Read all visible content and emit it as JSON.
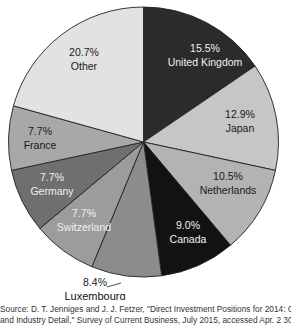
{
  "chart_data": {
    "type": "pie",
    "title": "",
    "categories": [
      "United Kingdom",
      "Japan",
      "Netherlands",
      "Canada",
      "Luxembourg",
      "Switzerland",
      "Germany",
      "France",
      "Other"
    ],
    "values": [
      15.5,
      12.9,
      10.5,
      9.0,
      8.4,
      7.7,
      7.7,
      7.7,
      20.7
    ],
    "labels": [
      "15.5%",
      "12.9%",
      "10.5%",
      "9.0%",
      "8.4%",
      "7.7%",
      "7.7%",
      "7.7%",
      "20.7%"
    ],
    "colors": [
      "#2b2b2b",
      "#c6c6c6",
      "#b3b3b3",
      "#121212",
      "#8c8c8c",
      "#9c9c9c",
      "#6f6f6f",
      "#a8a8a8",
      "#e2e2e2"
    ],
    "start_angle_deg": 0,
    "direction": "clockwise",
    "legend": "none (inline labels)"
  },
  "source_text_line1": "Source: D. T. Jenniges and J. J. Fetzer, \"Direct Investment Positions for 2014: Country",
  "source_text_line2": "and Industry Detail,\" Survey of Current Business, July 2015, accessed Apr. 2 30, 2016 http://"
}
